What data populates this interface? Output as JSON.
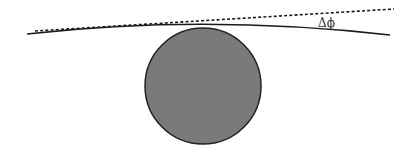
{
  "diagram": {
    "labels": {
      "deflection_angle": "Δϕ"
    },
    "colors": {
      "sphere_fill": "#7a7a7a",
      "sphere_stroke": "#222222",
      "ray_stroke": "#1a1a1a",
      "dashed_stroke": "#1a1a1a",
      "background": "#ffffff"
    },
    "elements": {
      "sphere": {
        "cx": 203,
        "cy": 86,
        "r": 58
      },
      "deflected_ray": {
        "start": [
          27,
          34
        ],
        "control": [
          205,
          14
        ],
        "end": [
          390,
          35
        ]
      },
      "undeflected_asymptote": {
        "start": [
          35,
          31
        ],
        "end": [
          394,
          9
        ],
        "style": "dashed"
      },
      "label_position": [
        318,
        18
      ]
    }
  }
}
